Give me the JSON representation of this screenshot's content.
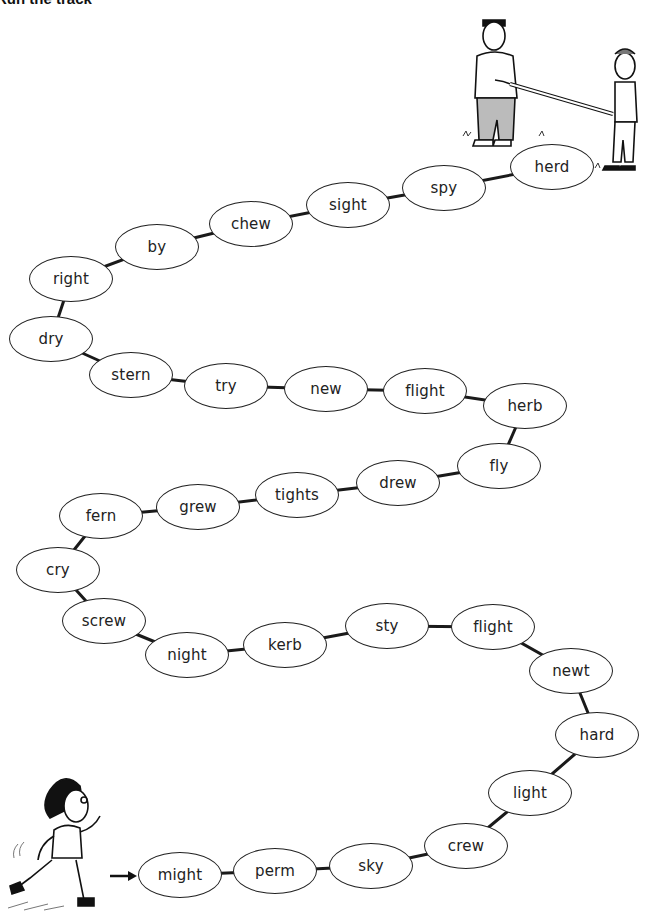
{
  "title": "Run the track",
  "start_arrow_icon": "right-arrow-icon",
  "illustrations": {
    "top_right": "two-people-holding-finish-tape",
    "bottom_left": "running-boy"
  },
  "track": {
    "words": [
      {
        "label": "might",
        "x": 180,
        "y": 875
      },
      {
        "label": "perm",
        "x": 275,
        "y": 871
      },
      {
        "label": "sky",
        "x": 371,
        "y": 866
      },
      {
        "label": "crew",
        "x": 466,
        "y": 846
      },
      {
        "label": "light",
        "x": 530,
        "y": 793
      },
      {
        "label": "hard",
        "x": 597,
        "y": 735
      },
      {
        "label": "newt",
        "x": 571,
        "y": 671
      },
      {
        "label": "flight",
        "x": 493,
        "y": 627
      },
      {
        "label": "sty",
        "x": 387,
        "y": 626
      },
      {
        "label": "kerb",
        "x": 285,
        "y": 645
      },
      {
        "label": "night",
        "x": 187,
        "y": 655
      },
      {
        "label": "screw",
        "x": 104,
        "y": 621
      },
      {
        "label": "cry",
        "x": 58,
        "y": 570
      },
      {
        "label": "fern",
        "x": 101,
        "y": 516
      },
      {
        "label": "grew",
        "x": 198,
        "y": 507
      },
      {
        "label": "tights",
        "x": 297,
        "y": 495
      },
      {
        "label": "drew",
        "x": 398,
        "y": 483
      },
      {
        "label": "fly",
        "x": 499,
        "y": 466
      },
      {
        "label": "herb",
        "x": 525,
        "y": 406
      },
      {
        "label": "flight",
        "x": 425,
        "y": 391
      },
      {
        "label": "new",
        "x": 326,
        "y": 389
      },
      {
        "label": "try",
        "x": 226,
        "y": 386
      },
      {
        "label": "stern",
        "x": 131,
        "y": 375
      },
      {
        "label": "dry",
        "x": 51,
        "y": 339
      },
      {
        "label": "right",
        "x": 71,
        "y": 279
      },
      {
        "label": "by",
        "x": 157,
        "y": 247
      },
      {
        "label": "chew",
        "x": 251,
        "y": 224
      },
      {
        "label": "sight",
        "x": 348,
        "y": 205
      },
      {
        "label": "spy",
        "x": 444,
        "y": 188
      },
      {
        "label": "herd",
        "x": 552,
        "y": 167
      }
    ]
  }
}
